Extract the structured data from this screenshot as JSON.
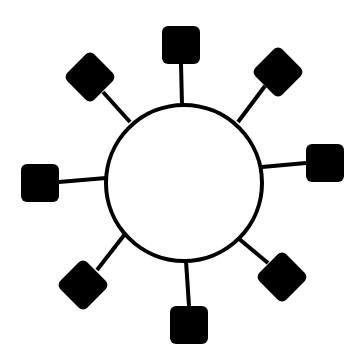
{
  "diagram": {
    "type": "star-topology",
    "colors": {
      "stroke": "#000000",
      "node_fill": "#000000",
      "hub_fill": "#ffffff",
      "background": "#ffffff"
    },
    "hub": {
      "cx": 184,
      "cy": 183,
      "r": 78,
      "stroke_width": 4
    },
    "node_size": 38,
    "node_corner_radius": 6,
    "nodes": [
      {
        "id": "top",
        "cx": 181,
        "cy": 45,
        "rotation": 0,
        "line": [
          181,
          64,
          182,
          105
        ]
      },
      {
        "id": "top-right",
        "cx": 278,
        "cy": 72,
        "rotation": 45,
        "line": [
          265,
          86,
          238,
          122
        ]
      },
      {
        "id": "right",
        "cx": 325,
        "cy": 163,
        "rotation": 0,
        "line": [
          306,
          163,
          262,
          167
        ]
      },
      {
        "id": "bottom-right",
        "cx": 282,
        "cy": 277,
        "rotation": 45,
        "line": [
          268,
          263,
          238,
          238
        ]
      },
      {
        "id": "bottom",
        "cx": 189,
        "cy": 325,
        "rotation": 0,
        "line": [
          189,
          306,
          186,
          261
        ]
      },
      {
        "id": "bottom-left",
        "cx": 83,
        "cy": 285,
        "rotation": 45,
        "line": [
          97,
          270,
          125,
          234
        ]
      },
      {
        "id": "left",
        "cx": 40,
        "cy": 183,
        "rotation": 0,
        "line": [
          59,
          182,
          106,
          178
        ]
      },
      {
        "id": "top-left",
        "cx": 90,
        "cy": 77,
        "rotation": 45,
        "line": [
          103,
          92,
          130,
          122
        ]
      }
    ]
  }
}
